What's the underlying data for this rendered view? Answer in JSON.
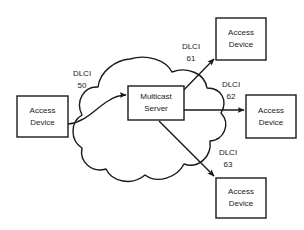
{
  "diagram": {
    "background_color": "#ffffff",
    "line_color": "#1a1a1a",
    "cloud": {
      "name": "frame-relay-cloud",
      "label": ""
    },
    "nodes": [
      {
        "id": "source-access-device",
        "line1": "Access",
        "line2": "Device",
        "x": 17,
        "y": 96,
        "w": 51,
        "h": 41
      },
      {
        "id": "multicast-server",
        "line1": "Multicast",
        "line2": "Server",
        "x": 128,
        "y": 86,
        "w": 56,
        "h": 34
      },
      {
        "id": "access-device-61",
        "line1": "Access",
        "line2": "Device",
        "x": 216,
        "y": 18,
        "w": 50,
        "h": 42
      },
      {
        "id": "access-device-62",
        "line1": "Access",
        "line2": "Device",
        "x": 246,
        "y": 95,
        "w": 50,
        "h": 43
      },
      {
        "id": "access-device-63",
        "line1": "Access",
        "line2": "Device",
        "x": 216,
        "y": 178,
        "w": 50,
        "h": 40
      }
    ],
    "links": [
      {
        "id": "dlci-50",
        "protocol": "DLCI",
        "value": "50",
        "label_x": 82,
        "label_y": 74,
        "from": "source-access-device",
        "to": "multicast-server"
      },
      {
        "id": "dlci-61",
        "protocol": "DLCI",
        "value": "61",
        "label_x": 191,
        "label_y": 47,
        "from": "multicast-server",
        "to": "access-device-61"
      },
      {
        "id": "dlci-62",
        "protocol": "DLCI",
        "value": "62",
        "label_x": 231,
        "label_y": 85,
        "from": "multicast-server",
        "to": "access-device-62"
      },
      {
        "id": "dlci-63",
        "protocol": "DLCI",
        "value": "63",
        "label_x": 228,
        "label_y": 153,
        "from": "multicast-server",
        "to": "access-device-63"
      }
    ]
  }
}
